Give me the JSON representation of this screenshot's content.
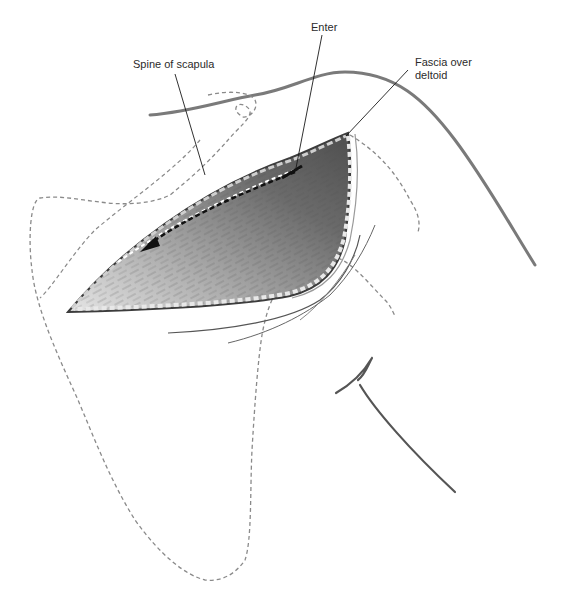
{
  "figure": {
    "labels": {
      "spine_of_scapula": "Spine of scapula",
      "enter": "Enter",
      "fascia_over_deltoid_line1": "Fascia over",
      "fascia_over_deltoid_line2": "deltoid"
    },
    "annotations": {
      "arrow": "dashed dissection arrow pointing infero-medially along the incision"
    }
  },
  "colors": {
    "background": "#ffffff",
    "skin_outline": "#7a7a7a",
    "bone_dashed_outline": "#8a8a8a",
    "leader_lines": "#1a1a1a",
    "incision_dark": "#3c3c3c",
    "muscle_mid": "#6e6e6e",
    "muscle_light": "#d9d9d9",
    "arrow": "#111111",
    "label_text": "#2b2b2b"
  }
}
